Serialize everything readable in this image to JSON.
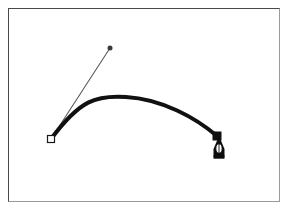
{
  "figure": {
    "title": "Bezier curve drawn with pen tool",
    "background_color": "#ffffff",
    "frame": {
      "border_color_dark": "#4a4a4a",
      "border_color_light": "#9a9a9a",
      "x": 8,
      "y": 8,
      "width": 272,
      "height": 194
    },
    "curve": {
      "name": "bezier-curve",
      "stroke_color": "#111111",
      "stroke_width": 4,
      "start_point": [
        51,
        139
      ],
      "end_point": [
        217,
        136
      ],
      "control_point_1": [
        110,
        48
      ],
      "control_point_2": [
        196,
        88
      ],
      "apex": [
        126,
        97
      ],
      "path": "M 51 139 C 80 100, 96 95, 126 97 C 162 99, 196 118, 217 136"
    },
    "handle": {
      "name": "control-handle",
      "stroke_color": "#5a5a5a",
      "stroke_width": 1,
      "from": [
        51,
        139
      ],
      "to": [
        110,
        48
      ]
    },
    "anchors": [
      {
        "name": "start-anchor-hollow-square",
        "shape": "hollow-square",
        "x": 51,
        "y": 139,
        "size": 7,
        "fill": "#ffffff",
        "stroke": "#1a1a1a"
      },
      {
        "name": "end-anchor-filled-square",
        "shape": "filled-square",
        "x": 217,
        "y": 136,
        "size": 8,
        "fill": "#101010",
        "stroke": "#101010"
      },
      {
        "name": "control-point-dot",
        "shape": "filled-dot",
        "x": 110,
        "y": 48,
        "size": 5,
        "fill": "#3a3a3a",
        "stroke": "#3a3a3a"
      }
    ],
    "cursor": {
      "name": "pen-tool-cursor",
      "type": "pen-nib",
      "x": 219,
      "y": 148,
      "fill": "#0d0d0d",
      "inner_fill": "#ffffff",
      "width": 14,
      "height": 26
    }
  }
}
